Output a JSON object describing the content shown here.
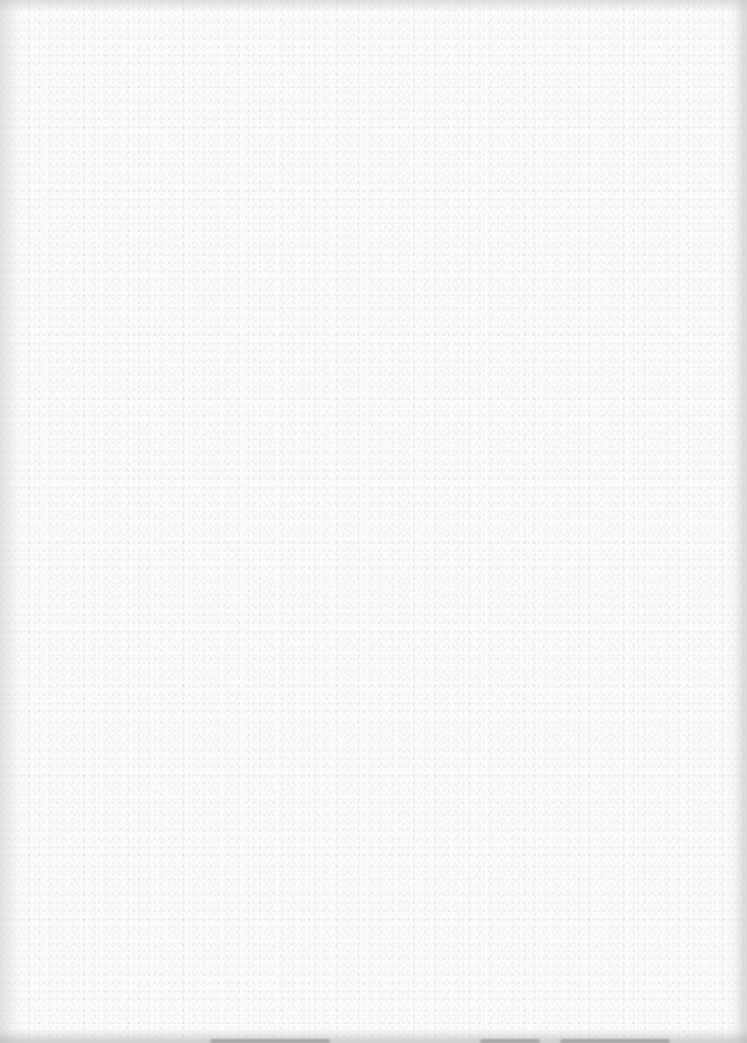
{
  "page": {
    "type": "blank-scanned-sheet",
    "background_color": "#fbfbfb",
    "edge_shade_color": "#c8c8c8",
    "smudge_color": "#787878"
  },
  "smudges": [
    {
      "left": 210,
      "width": 120
    },
    {
      "left": 480,
      "width": 60
    },
    {
      "left": 560,
      "width": 110
    }
  ]
}
